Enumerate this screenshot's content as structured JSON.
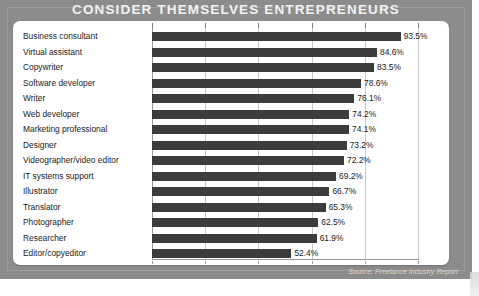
{
  "header": {
    "title": "CONSIDER THEMSELVES ENTREPRENEURS"
  },
  "footer": {
    "source": "Source: Freelance Industry Report"
  },
  "colors": {
    "frame": "#8c8c8c",
    "card": "#ffffff",
    "bar": "#3c3c3c",
    "title_text": "#f2f2f2",
    "gridline": "#c8c8c8"
  },
  "chart_data": {
    "type": "bar",
    "orientation": "horizontal",
    "title": "CONSIDER THEMSELVES ENTREPRENEURS",
    "subtitle": "",
    "xlabel": "",
    "ylabel": "",
    "xlim": [
      0,
      100
    ],
    "grid": true,
    "legend": null,
    "annotation": "Source: Freelance Industry Report",
    "tick_labels": [
      "0%",
      "20%",
      "40%",
      "60%",
      "80%",
      "100%"
    ],
    "ticks": [
      0,
      20,
      40,
      60,
      80,
      100
    ],
    "value_suffix": "%",
    "categories": [
      "Business consultant",
      "Virtual assistant",
      "Copywriter",
      "Software developer",
      "Writer",
      "Web developer",
      "Marketing professional",
      "Designer",
      "Videographer/video editor",
      "IT systems support",
      "Illustrator",
      "Translator",
      "Photographer",
      "Researcher",
      "Editor/copyeditor"
    ],
    "values": [
      93.5,
      84.6,
      83.5,
      78.6,
      76.1,
      74.2,
      74.1,
      73.2,
      72.2,
      69.2,
      66.7,
      65.3,
      62.5,
      61.9,
      52.4
    ],
    "value_labels": [
      "93.5%",
      "84.6%",
      "83.5%",
      "78.6%",
      "76.1%",
      "74.2%",
      "74.1%",
      "73.2%",
      "72.2%",
      "69.2%",
      "66.7%",
      "65.3%",
      "62.5%",
      "61.9%",
      "52.4%"
    ]
  }
}
